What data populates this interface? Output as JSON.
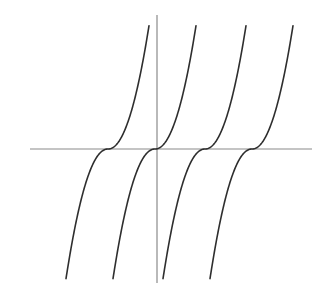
{
  "chart_data": {
    "type": "line",
    "title": "",
    "xlabel": "",
    "ylabel": "",
    "grid": false,
    "legend": null,
    "axes": {
      "x_axis": {
        "x1": 30,
        "x2": 312,
        "y": 149
      },
      "y_axis": {
        "x": 157,
        "y1": 15,
        "y2": 283
      },
      "color": "#8a8a8a"
    },
    "curve_shape": {
      "formula": "dy = -sign(dx) * c * |dx|^p",
      "c": 0.0506,
      "p": 2.1,
      "dx_min": -42,
      "dx_max": 41
    },
    "series": [
      {
        "name": "curve-1",
        "inflection_x": 108,
        "inflection_y": 149,
        "color": "#2e2e2e"
      },
      {
        "name": "curve-2",
        "inflection_x": 155,
        "inflection_y": 149,
        "color": "#2e2e2e"
      },
      {
        "name": "curve-3",
        "inflection_x": 205,
        "inflection_y": 149,
        "color": "#2e2e2e"
      },
      {
        "name": "curve-4",
        "inflection_x": 252,
        "inflection_y": 149,
        "color": "#2e2e2e"
      }
    ],
    "sample_points_curve_1": [
      {
        "x": 66,
        "y": 275
      },
      {
        "x": 70,
        "y": 250
      },
      {
        "x": 80,
        "y": 200
      },
      {
        "x": 92,
        "y": 160
      },
      {
        "x": 108,
        "y": 149
      },
      {
        "x": 120,
        "y": 140
      },
      {
        "x": 134,
        "y": 100
      },
      {
        "x": 143,
        "y": 60
      },
      {
        "x": 149,
        "y": 26
      }
    ]
  }
}
